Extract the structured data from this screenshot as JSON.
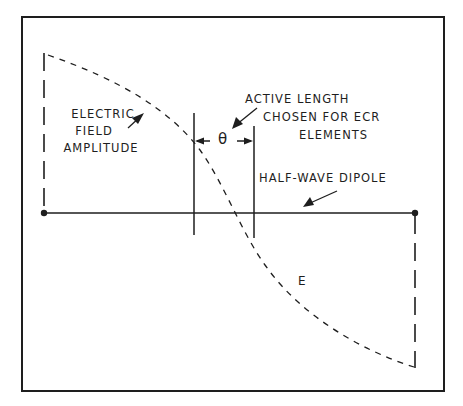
{
  "diagram": {
    "labels": {
      "field_line1": "ELECTRIC",
      "field_line2": "FIELD",
      "field_line3": "AMPLITUDE",
      "active_line1": "ACTIVE LENGTH",
      "active_line2": "CHOSEN FOR ECR",
      "active_line3": "ELEMENTS",
      "theta": "θ",
      "dipole": "HALF-WAVE DIPOLE",
      "e_symbol": "E"
    },
    "colors": {
      "ink": "#1e1e1e",
      "background": "#ffffff"
    }
  }
}
